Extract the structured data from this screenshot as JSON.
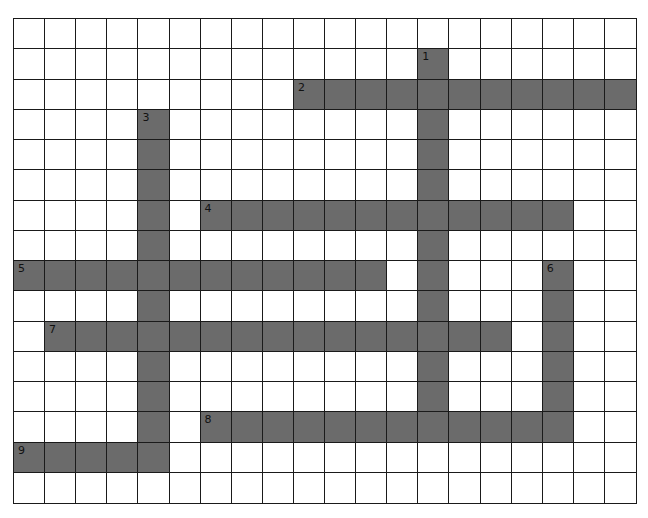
{
  "puzzle": {
    "type": "crossword",
    "cols": 20,
    "rows": 16,
    "colors": {
      "filled": "#6b6b6b",
      "empty": "#ffffff",
      "line": "#1a1a1a"
    },
    "entries": [
      {
        "number": "1",
        "direction": "down",
        "col": 13,
        "row": 1,
        "length": 13
      },
      {
        "number": "2",
        "direction": "across",
        "col": 9,
        "row": 2,
        "length": 11
      },
      {
        "number": "3",
        "direction": "down",
        "col": 4,
        "row": 3,
        "length": 12
      },
      {
        "number": "4",
        "direction": "across",
        "col": 6,
        "row": 6,
        "length": 12
      },
      {
        "number": "5",
        "direction": "across",
        "col": 0,
        "row": 8,
        "length": 12
      },
      {
        "number": "6",
        "direction": "down",
        "col": 17,
        "row": 8,
        "length": 6
      },
      {
        "number": "7",
        "direction": "across",
        "col": 1,
        "row": 10,
        "length": 15
      },
      {
        "number": "8",
        "direction": "across",
        "col": 6,
        "row": 13,
        "length": 12
      },
      {
        "number": "9",
        "direction": "across",
        "col": 0,
        "row": 14,
        "length": 5
      }
    ]
  }
}
